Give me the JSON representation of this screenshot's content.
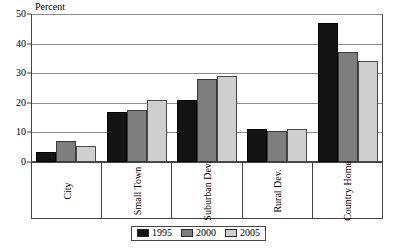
{
  "chart_data": {
    "type": "bar",
    "title": "",
    "ylabel": "Percent",
    "xlabel": "",
    "ylim": [
      0,
      50
    ],
    "yticks": [
      0,
      10,
      20,
      30,
      40,
      50
    ],
    "grid": true,
    "legend_position": "bottom-center",
    "categories": [
      "City",
      "Small Town",
      "Suburban Dev.",
      "Rural Dev.",
      "Country Home"
    ],
    "series": [
      {
        "name": "1995",
        "color": "#141414",
        "values": [
          3.5,
          17,
          21,
          11,
          47
        ]
      },
      {
        "name": "2000",
        "color": "#7e7e7e",
        "values": [
          7,
          17.5,
          28,
          10.5,
          37
        ]
      },
      {
        "name": "2005",
        "color": "#cfcfcf",
        "values": [
          5.5,
          21,
          29,
          11,
          34
        ]
      }
    ]
  }
}
